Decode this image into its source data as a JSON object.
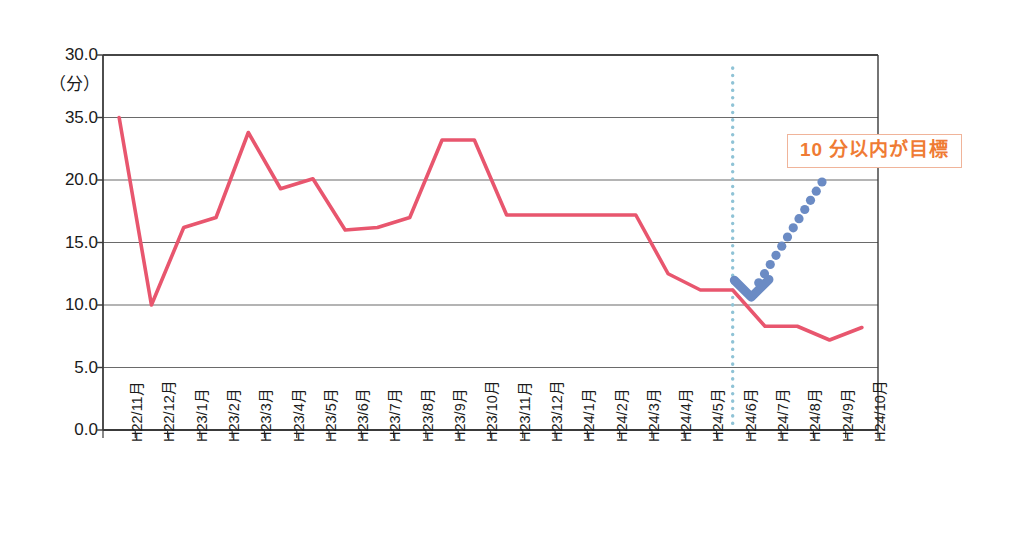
{
  "chart_data": {
    "type": "line",
    "title": "",
    "xlabel": "",
    "ylabel": "",
    "yunit_label": "（分）",
    "ytick_labels": [
      "30.0",
      "35.0",
      "20.0",
      "15.0",
      "10.0",
      "5.0",
      "0.0"
    ],
    "ytick_values": [
      30,
      25,
      20,
      15,
      10,
      5,
      0
    ],
    "ylim": [
      0,
      30
    ],
    "grid": true,
    "legend": "none",
    "categories": [
      "H22/11月",
      "H22/12月",
      "H23/1月",
      "H23/2月",
      "H23/3月",
      "H23/4月",
      "H23/5月",
      "H23/6月",
      "H23/7月",
      "H23/8月",
      "H23/9月",
      "H23/10月",
      "H23/11月",
      "H23/12月",
      "H24/1月",
      "H24/2月",
      "H24/3月",
      "H24/4月",
      "H24/5月",
      "H24/6月",
      "H24/7月",
      "H24/8月",
      "H24/9月",
      "H24/10月"
    ],
    "series": [
      {
        "name": "平均所要時間",
        "color": "#e8566e",
        "values": [
          25.0,
          10.0,
          16.2,
          17.0,
          23.8,
          19.3,
          20.1,
          16.0,
          16.2,
          17.0,
          23.2,
          23.2,
          17.2,
          17.2,
          17.2,
          17.2,
          17.2,
          12.5,
          11.2,
          11.2,
          8.3,
          8.3,
          7.2,
          8.2
        ]
      }
    ],
    "annotations": [
      {
        "name": "target-callout",
        "text": "10 分以内が目標",
        "color": "#ef7b34",
        "border_color": "#f0b49a"
      },
      {
        "name": "improvement-trend-arrow",
        "style": "dotted-arrow",
        "color": "#6b8bc4",
        "direction": "up-right"
      },
      {
        "name": "period-divider",
        "style": "vertical-dotted-line",
        "color": "#8fc3d6",
        "at_category": "H24/6月"
      }
    ],
    "axis_color": "#3a3a3a",
    "grid_color": "#6a6a6a",
    "background": "#ffffff"
  }
}
